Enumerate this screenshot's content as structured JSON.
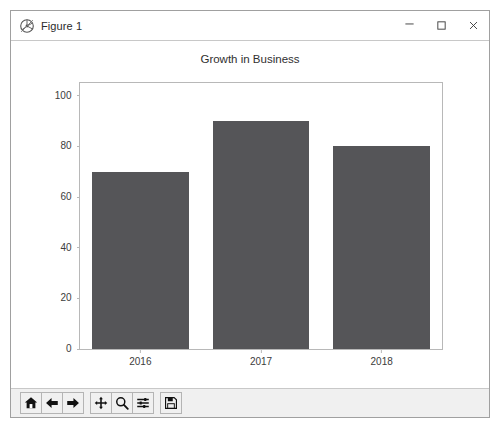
{
  "window": {
    "title": "Figure 1",
    "icon": "matplotlib-logo-icon",
    "controls": {
      "minimize": "─",
      "maximize": "maximize-icon",
      "close": "×"
    }
  },
  "chart_data": {
    "type": "bar",
    "title": "Growth in Business",
    "categories": [
      "2016",
      "2017",
      "2018"
    ],
    "values": [
      70,
      90,
      80
    ],
    "xlabel": "",
    "ylabel": "",
    "ylim": [
      0,
      105
    ],
    "yticks": [
      0,
      20,
      40,
      60,
      80,
      100
    ],
    "ytick_labels": [
      "0",
      "20",
      "40",
      "60",
      "80",
      "100"
    ],
    "grid": false,
    "legend": null,
    "bar_color": "#555558",
    "bar_width": 0.8,
    "axes_edge_color": "#b8b8b8",
    "background": "#ffffff"
  },
  "toolbar": {
    "buttons": [
      {
        "name": "home-icon",
        "label": "Home"
      },
      {
        "name": "back-arrow-icon",
        "label": "Back"
      },
      {
        "name": "forward-arrow-icon",
        "label": "Forward"
      },
      {
        "name": "pan-icon",
        "label": "Pan"
      },
      {
        "name": "zoom-icon",
        "label": "Zoom"
      },
      {
        "name": "configure-subplots-icon",
        "label": "Configure subplots"
      },
      {
        "name": "save-icon",
        "label": "Save"
      }
    ]
  }
}
